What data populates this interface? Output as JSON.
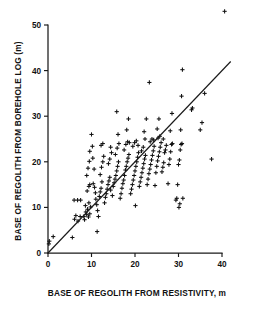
{
  "figure": {
    "title": "",
    "background": "#ffffff",
    "ink_color": "#111111"
  },
  "chart_data": {
    "type": "scatter",
    "title": "",
    "xlabel": "BASE OF REGOLITH FROM RESISTIVITY, m",
    "ylabel": "BASE OF REGOLITH FROM BOREHOLE LOG (m)",
    "xlim": [
      0,
      40
    ],
    "ylim": [
      0,
      50
    ],
    "xticks": [
      0,
      10,
      20,
      30,
      40
    ],
    "yticks": [
      0,
      10,
      20,
      30,
      40,
      50
    ],
    "xtick_labels": [
      "0",
      "10",
      "20",
      "30",
      "40"
    ],
    "ytick_labels": [
      "0",
      "10",
      "20",
      "30",
      "40",
      "50"
    ],
    "grid": false,
    "legend": null,
    "marker": "plus",
    "marker_color": "#111111",
    "reference_line": {
      "name": "1:1 line",
      "type": "line",
      "slope": 1,
      "intercept": 0,
      "x_start": 0,
      "y_start": 0,
      "x_end": 42,
      "y_end": 42,
      "color": "#111111"
    },
    "series": [
      {
        "name": "Regolith base depth comparison",
        "points": [
          [
            0.2,
            2.0
          ],
          [
            0.3,
            2.6
          ],
          [
            1.2,
            3.6
          ],
          [
            5.6,
            3.4
          ],
          [
            6.1,
            7.4
          ],
          [
            6.4,
            8.2
          ],
          [
            6.9,
            7.0
          ],
          [
            7.4,
            8.0
          ],
          [
            6.0,
            11.6
          ],
          [
            6.8,
            11.6
          ],
          [
            7.5,
            11.6
          ],
          [
            8.2,
            8.0
          ],
          [
            8.4,
            7.3
          ],
          [
            8.7,
            9.0
          ],
          [
            8.9,
            8.4
          ],
          [
            9.1,
            9.6
          ],
          [
            9.3,
            7.9
          ],
          [
            9.6,
            8.6
          ],
          [
            9.8,
            10.1
          ],
          [
            9.4,
            11.0
          ],
          [
            8.6,
            10.4
          ],
          [
            9.0,
            13.6
          ],
          [
            9.4,
            14.6
          ],
          [
            9.6,
            15.0
          ],
          [
            8.9,
            17.0
          ],
          [
            9.2,
            18.6
          ],
          [
            9.5,
            20.1
          ],
          [
            9.6,
            22.3
          ],
          [
            10.0,
            26.0
          ],
          [
            10.2,
            23.4
          ],
          [
            10.3,
            20.8
          ],
          [
            10.6,
            18.4
          ],
          [
            10.4,
            15.2
          ],
          [
            10.7,
            14.4
          ],
          [
            10.9,
            13.2
          ],
          [
            11.0,
            11.8
          ],
          [
            11.2,
            10.6
          ],
          [
            11.4,
            9.3
          ],
          [
            11.6,
            8.0
          ],
          [
            11.3,
            4.7
          ],
          [
            11.8,
            12.4
          ],
          [
            12.0,
            13.4
          ],
          [
            12.2,
            14.2
          ],
          [
            12.4,
            15.6
          ],
          [
            12.0,
            17.2
          ],
          [
            12.3,
            18.8
          ],
          [
            12.6,
            20.0
          ],
          [
            12.8,
            21.2
          ],
          [
            12.2,
            23.6
          ],
          [
            12.6,
            24.0
          ],
          [
            13.0,
            11.0
          ],
          [
            13.2,
            12.2
          ],
          [
            13.4,
            13.0
          ],
          [
            13.6,
            14.0
          ],
          [
            13.8,
            15.0
          ],
          [
            14.0,
            15.8
          ],
          [
            14.2,
            16.6
          ],
          [
            14.4,
            13.8
          ],
          [
            13.9,
            19.6
          ],
          [
            14.2,
            20.6
          ],
          [
            14.6,
            22.0
          ],
          [
            14.4,
            23.2
          ],
          [
            14.8,
            12.6
          ],
          [
            15.0,
            14.6
          ],
          [
            15.2,
            15.4
          ],
          [
            15.4,
            16.2
          ],
          [
            15.6,
            17.0
          ],
          [
            15.8,
            18.0
          ],
          [
            16.0,
            19.0
          ],
          [
            16.2,
            20.0
          ],
          [
            15.5,
            21.6
          ],
          [
            15.9,
            23.0
          ],
          [
            16.3,
            24.0
          ],
          [
            16.1,
            26.0
          ],
          [
            15.8,
            31.0
          ],
          [
            16.6,
            12.0
          ],
          [
            16.8,
            13.0
          ],
          [
            17.0,
            14.2
          ],
          [
            17.2,
            15.2
          ],
          [
            17.4,
            16.0
          ],
          [
            17.6,
            17.0
          ],
          [
            17.8,
            18.2
          ],
          [
            18.0,
            19.0
          ],
          [
            18.2,
            20.0
          ],
          [
            18.4,
            20.8
          ],
          [
            18.6,
            21.6
          ],
          [
            17.5,
            22.6
          ],
          [
            17.9,
            23.8
          ],
          [
            18.3,
            24.4
          ],
          [
            18.7,
            24.2
          ],
          [
            18.1,
            27.0
          ],
          [
            18.5,
            29.4
          ],
          [
            19.0,
            13.0
          ],
          [
            19.2,
            14.0
          ],
          [
            19.4,
            15.0
          ],
          [
            19.6,
            16.0
          ],
          [
            19.8,
            17.0
          ],
          [
            20.0,
            18.0
          ],
          [
            20.2,
            19.0
          ],
          [
            20.4,
            20.0
          ],
          [
            20.6,
            21.0
          ],
          [
            20.8,
            22.0
          ],
          [
            19.5,
            23.4
          ],
          [
            19.9,
            24.2
          ],
          [
            20.3,
            24.6
          ],
          [
            20.7,
            23.6
          ],
          [
            20.1,
            10.4
          ],
          [
            21.0,
            14.6
          ],
          [
            21.2,
            15.6
          ],
          [
            21.4,
            16.6
          ],
          [
            21.6,
            17.6
          ],
          [
            21.8,
            18.6
          ],
          [
            22.0,
            19.6
          ],
          [
            22.2,
            20.6
          ],
          [
            22.4,
            21.4
          ],
          [
            21.5,
            22.4
          ],
          [
            21.9,
            23.2
          ],
          [
            22.3,
            25.0
          ],
          [
            22.1,
            26.6
          ],
          [
            22.6,
            29.4
          ],
          [
            22.8,
            15.0
          ],
          [
            23.0,
            16.2
          ],
          [
            23.2,
            17.4
          ],
          [
            23.4,
            18.4
          ],
          [
            23.6,
            19.4
          ],
          [
            23.8,
            20.4
          ],
          [
            24.0,
            21.4
          ],
          [
            24.2,
            22.4
          ],
          [
            24.4,
            23.4
          ],
          [
            23.5,
            24.4
          ],
          [
            23.9,
            25.0
          ],
          [
            24.3,
            24.8
          ],
          [
            23.3,
            37.4
          ],
          [
            24.6,
            14.8
          ],
          [
            24.8,
            17.6
          ],
          [
            25.0,
            19.0
          ],
          [
            25.2,
            20.2
          ],
          [
            25.4,
            21.2
          ],
          [
            25.6,
            22.2
          ],
          [
            25.8,
            23.2
          ],
          [
            26.0,
            24.2
          ],
          [
            25.3,
            25.2
          ],
          [
            25.7,
            25.6
          ],
          [
            25.1,
            27.2
          ],
          [
            25.5,
            29.4
          ],
          [
            26.2,
            17.8
          ],
          [
            26.4,
            18.8
          ],
          [
            26.6,
            19.8
          ],
          [
            26.8,
            22.0
          ],
          [
            27.0,
            22.6
          ],
          [
            27.2,
            23.6
          ],
          [
            26.5,
            25.0
          ],
          [
            27.6,
            15.2
          ],
          [
            27.8,
            19.4
          ],
          [
            28.0,
            20.6
          ],
          [
            28.2,
            22.2
          ],
          [
            28.4,
            23.8
          ],
          [
            28.6,
            24.0
          ],
          [
            28.1,
            26.8
          ],
          [
            28.5,
            30.6
          ],
          [
            29.4,
            11.6
          ],
          [
            29.6,
            12.0
          ],
          [
            29.8,
            15.0
          ],
          [
            30.0,
            19.4
          ],
          [
            30.2,
            20.4
          ],
          [
            30.4,
            22.6
          ],
          [
            30.6,
            23.8
          ],
          [
            30.8,
            24.0
          ],
          [
            30.1,
            10.0
          ],
          [
            30.3,
            10.8
          ],
          [
            30.5,
            27.0
          ],
          [
            30.7,
            34.4
          ],
          [
            30.9,
            40.2
          ],
          [
            31.0,
            12.0
          ],
          [
            33.0,
            31.4
          ],
          [
            33.2,
            31.8
          ],
          [
            35.0,
            27.0
          ],
          [
            35.4,
            28.6
          ],
          [
            36.0,
            35.0
          ],
          [
            37.6,
            20.6
          ]
        ]
      }
    ],
    "outlier_point": {
      "name": "outlier-above-axes",
      "description": "marker plotted above the top of the axes frame",
      "x": 40.6,
      "y": 53.0
    },
    "n_points": 176
  }
}
